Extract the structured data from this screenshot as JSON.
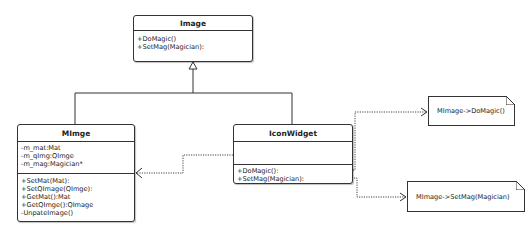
{
  "diagram": {
    "type": "UML class diagram",
    "classes": {
      "image": {
        "name": "Image",
        "attributes": [],
        "methods": [
          "+DoMagic()",
          "+SetMag(Magician):"
        ]
      },
      "mimge": {
        "name": "MImge",
        "attributes": [
          "-m_mat:Mat",
          "-m_qImg:QImge",
          "-m_mag:Magician*"
        ],
        "methods": [
          "+SetMat(Mat):",
          "+SetQImage(QImge):",
          "+GetMat():Mat",
          "+GetQImge():QImage",
          "-UnpateImage()"
        ]
      },
      "iconwidget": {
        "name": "IconWidget",
        "attributes": [],
        "methods": [
          "+DoMagic():",
          "+SetMag(Magician):"
        ]
      }
    },
    "notes": {
      "domagic": "MImage->DoMagic()",
      "setmag": "MImage->SetMag(Magician)"
    },
    "relationships": [
      {
        "type": "generalization",
        "from": "MImge",
        "to": "Image"
      },
      {
        "type": "generalization",
        "from": "IconWidget",
        "to": "Image"
      },
      {
        "type": "dependency",
        "from": "IconWidget",
        "to": "MImge"
      },
      {
        "type": "note-link",
        "from": "IconWidget.DoMagic",
        "to": "MImage->DoMagic()"
      },
      {
        "type": "note-link",
        "from": "IconWidget.SetMag",
        "to": "MImage->SetMag(Magician)"
      }
    ],
    "colors": {
      "line": "#333333",
      "background": "#ffffff"
    }
  }
}
